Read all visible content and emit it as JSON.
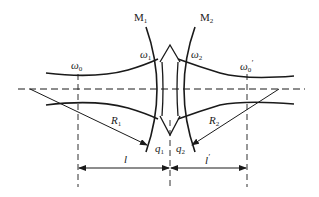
{
  "diagram": {
    "colors": {
      "line": "#1a1a1a",
      "background": "#ffffff"
    },
    "labels": {
      "mirror1": {
        "base": "M",
        "sub": "1"
      },
      "mirror2": {
        "base": "M",
        "sub": "2"
      },
      "waist_left": {
        "base": "ω",
        "sub": "0"
      },
      "waist_right": {
        "base": "ω",
        "sub": "0",
        "prime": "′"
      },
      "spot1": {
        "base": "ω",
        "sub": "1"
      },
      "spot2": {
        "base": "ω",
        "sub": "2"
      },
      "radius1": {
        "base": "R",
        "sub": "1"
      },
      "radius2": {
        "base": "R",
        "sub": "2"
      },
      "q1": {
        "base": "q",
        "sub": "1"
      },
      "q2": {
        "base": "q",
        "sub": "2"
      },
      "dist_left": {
        "base": "l"
      },
      "dist_right": {
        "base": "l",
        "prime": "′"
      }
    }
  }
}
